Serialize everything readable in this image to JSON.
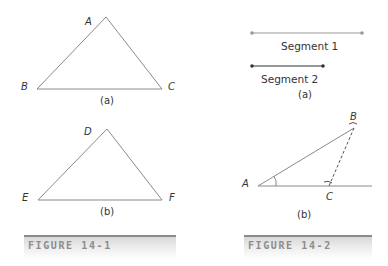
{
  "figure_14_1": {
    "caption": "FIGURE 14-1",
    "triangle_a": {
      "vertices": [
        "A",
        "B",
        "C"
      ],
      "label": "(a)"
    },
    "triangle_b": {
      "vertices": [
        "D",
        "E",
        "F"
      ],
      "label": "(b)"
    }
  },
  "figure_14_2": {
    "caption": "FIGURE 14-2",
    "part_a": {
      "segment1_label": "Segment 1",
      "segment2_label": "Segment 2",
      "label": "(a)"
    },
    "part_b": {
      "points": [
        "A",
        "B",
        "C"
      ],
      "label": "(b)"
    }
  },
  "colors": {
    "line": "#8a8a8a",
    "segment1": "#9a9a9a",
    "segment2": "#333333",
    "caption_text": "#8c8c8c"
  }
}
